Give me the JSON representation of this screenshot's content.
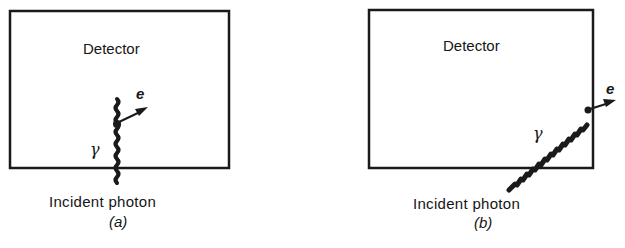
{
  "panels": [
    {
      "id": "a",
      "detector_label": "Detector",
      "photon_symbol": "γ",
      "electron_symbol": "e",
      "caption": "Incident photon",
      "sublabel": "(a)",
      "description": "Photon enters from bottom and interacts inside detector, producing an electron that stays within the detector volume"
    },
    {
      "id": "b",
      "detector_label": "Detector",
      "photon_symbol": "γ",
      "electron_symbol": "e",
      "caption": "Incident photon",
      "sublabel": "(b)",
      "description": "Photon enters diagonally and interacts near the edge, producing an electron that escapes the detector"
    }
  ],
  "colors": {
    "line": "#1a1a1a",
    "background": "#ffffff"
  }
}
